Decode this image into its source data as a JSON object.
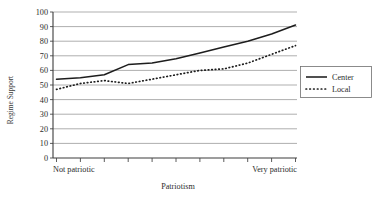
{
  "chart_data": {
    "type": "line",
    "title": "",
    "xlabel": "Patriotism",
    "ylabel": "Regime Support",
    "ylim": [
      0,
      100
    ],
    "ytick_labels": [
      "0",
      "10",
      "20",
      "30",
      "40",
      "50",
      "60",
      "70",
      "80",
      "90",
      "100"
    ],
    "ytick_values": [
      0,
      10,
      20,
      30,
      40,
      50,
      60,
      70,
      80,
      90,
      100
    ],
    "grid": true,
    "legend_position": "right-outside",
    "x_category_left": "Not patriotic",
    "x_category_right": "Very patriotic",
    "x": [
      1,
      2,
      3,
      4,
      5,
      6,
      7,
      8,
      9,
      10,
      11
    ],
    "series": [
      {
        "name": "Center",
        "style": "solid",
        "color": "#1d1d1d",
        "values": [
          54,
          55,
          57,
          64,
          65,
          68,
          72,
          76,
          80,
          85,
          91
        ]
      },
      {
        "name": "Local",
        "style": "dotted",
        "color": "#1d1d1d",
        "values": [
          47,
          51,
          53,
          51,
          54,
          57,
          60,
          61,
          65,
          71,
          77
        ]
      }
    ]
  },
  "legend": {
    "items": [
      {
        "label": "Center",
        "style": "solid"
      },
      {
        "label": "Local",
        "style": "dotted"
      }
    ]
  }
}
